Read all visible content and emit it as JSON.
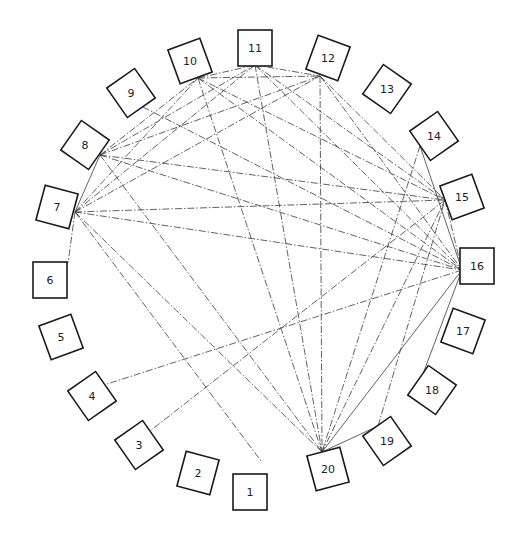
{
  "diagram": {
    "type": "circular network diagram",
    "nodes": [
      {
        "id": "1",
        "label": "1",
        "x": 250,
        "y": 492,
        "rot": 0
      },
      {
        "id": "2",
        "label": "2",
        "x": 198,
        "y": 473,
        "rot": 15
      },
      {
        "id": "3",
        "label": "3",
        "x": 139,
        "y": 445,
        "rot": -35
      },
      {
        "id": "4",
        "label": "4",
        "x": 92,
        "y": 396,
        "rot": -35
      },
      {
        "id": "5",
        "label": "5",
        "x": 61,
        "y": 337,
        "rot": -20
      },
      {
        "id": "6",
        "label": "6",
        "x": 50,
        "y": 280,
        "rot": 0
      },
      {
        "id": "7",
        "label": "7",
        "x": 57,
        "y": 207,
        "rot": 15
      },
      {
        "id": "8",
        "label": "8",
        "x": 85,
        "y": 145,
        "rot": 35
      },
      {
        "id": "9",
        "label": "9",
        "x": 131,
        "y": 93,
        "rot": -35
      },
      {
        "id": "10",
        "label": "10",
        "x": 190,
        "y": 61,
        "rot": -20
      },
      {
        "id": "11",
        "label": "11",
        "x": 255,
        "y": 48,
        "rot": 0
      },
      {
        "id": "12",
        "label": "12",
        "x": 328,
        "y": 58,
        "rot": 20
      },
      {
        "id": "13",
        "label": "13",
        "x": 387,
        "y": 89,
        "rot": 35
      },
      {
        "id": "14",
        "label": "14",
        "x": 434,
        "y": 136,
        "rot": -35
      },
      {
        "id": "15",
        "label": "15",
        "x": 462,
        "y": 197,
        "rot": -20
      },
      {
        "id": "16",
        "label": "16",
        "x": 477,
        "y": 266,
        "rot": 0
      },
      {
        "id": "17",
        "label": "17",
        "x": 463,
        "y": 331,
        "rot": 20
      },
      {
        "id": "18",
        "label": "18",
        "x": 432,
        "y": 390,
        "rot": 35
      },
      {
        "id": "19",
        "label": "19",
        "x": 387,
        "y": 441,
        "rot": -35
      },
      {
        "id": "20",
        "label": "20",
        "x": 328,
        "y": 469,
        "rot": -15
      }
    ],
    "anchors": {
      "1": [
        261,
        461
      ],
      "3": [
        150,
        431
      ],
      "4": [
        107,
        384
      ],
      "6": [
        68,
        263
      ],
      "7": [
        75,
        212
      ],
      "8": [
        100,
        155
      ],
      "9": [
        143,
        107
      ],
      "10": [
        198,
        78
      ],
      "11": [
        255,
        65
      ],
      "12": [
        320,
        76
      ],
      "14": [
        420,
        146
      ],
      "15": [
        445,
        200
      ],
      "16": [
        462,
        270
      ],
      "18": [
        421,
        379
      ],
      "19": [
        378,
        426
      ],
      "20": [
        322,
        452
      ]
    },
    "edges": [
      [
        "7",
        "8"
      ],
      [
        "7",
        "10"
      ],
      [
        "7",
        "11"
      ],
      [
        "7",
        "12"
      ],
      [
        "7",
        "15"
      ],
      [
        "7",
        "16"
      ],
      [
        "7",
        "20"
      ],
      [
        "7",
        "1"
      ],
      [
        "7",
        "6"
      ],
      [
        "8",
        "10"
      ],
      [
        "8",
        "11"
      ],
      [
        "8",
        "12"
      ],
      [
        "8",
        "15"
      ],
      [
        "8",
        "16"
      ],
      [
        "8",
        "20"
      ],
      [
        "10",
        "11"
      ],
      [
        "10",
        "12"
      ],
      [
        "10",
        "15"
      ],
      [
        "10",
        "16"
      ],
      [
        "10",
        "20"
      ],
      [
        "11",
        "12"
      ],
      [
        "11",
        "15"
      ],
      [
        "11",
        "16"
      ],
      [
        "11",
        "20"
      ],
      [
        "12",
        "15"
      ],
      [
        "12",
        "16"
      ],
      [
        "12",
        "20"
      ],
      [
        "9",
        "16"
      ],
      [
        "14",
        "16"
      ],
      [
        "14",
        "20"
      ],
      [
        "15",
        "16"
      ],
      [
        "15",
        "20"
      ],
      [
        "16",
        "20"
      ],
      [
        "16",
        "18"
      ],
      [
        "19",
        "20"
      ],
      [
        "19",
        "15"
      ],
      [
        "16",
        "4"
      ],
      [
        "15",
        "3"
      ]
    ],
    "solid_edges": [
      [
        "7",
        "8"
      ],
      [
        "19",
        "20"
      ],
      [
        "16",
        "18"
      ],
      [
        "16",
        "20"
      ],
      [
        "14",
        "16"
      ]
    ],
    "colors": {
      "line": "#3a3a3a",
      "box": "#1a1a1a",
      "background": "#ffffff"
    }
  }
}
